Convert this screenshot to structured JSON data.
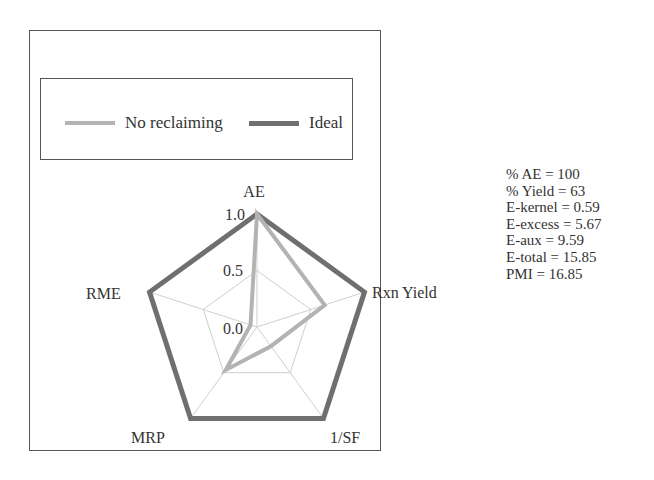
{
  "chart_data": {
    "type": "radar",
    "title": "",
    "axes": [
      "AE",
      "Rxn Yield",
      "1/SF",
      "MRP",
      "RME"
    ],
    "radial_ticks": [
      "0.0",
      "0.5",
      "1.0"
    ],
    "rlim": [
      0,
      1
    ],
    "grid": true,
    "legend_position": "top (boxed)",
    "series": [
      {
        "name": "No reclaiming",
        "color": "#b3b3b3",
        "values": [
          1.0,
          0.63,
          0.21,
          0.47,
          0.06
        ]
      },
      {
        "name": "Ideal",
        "color": "#6f6f6f",
        "values": [
          1.0,
          1.0,
          1.0,
          1.0,
          1.0
        ]
      }
    ]
  },
  "legend": {
    "items": [
      {
        "label": "No reclaiming",
        "color": "#b3b3b3"
      },
      {
        "label": "Ideal",
        "color": "#6f6f6f"
      }
    ]
  },
  "axis_labels": {
    "ae": "AE",
    "rxn_yield": "Rxn Yield",
    "sf": "1/SF",
    "mrp": "MRP",
    "rme": "RME"
  },
  "ticks": {
    "t0": "0.0",
    "t05": "0.5",
    "t1": "1.0"
  },
  "metrics": [
    "% AE = 100",
    "% Yield = 63",
    "E-kernel = 0.59",
    "E-excess = 5.67",
    "E-aux = 9.59",
    "E-total = 15.85",
    "PMI = 16.85"
  ]
}
